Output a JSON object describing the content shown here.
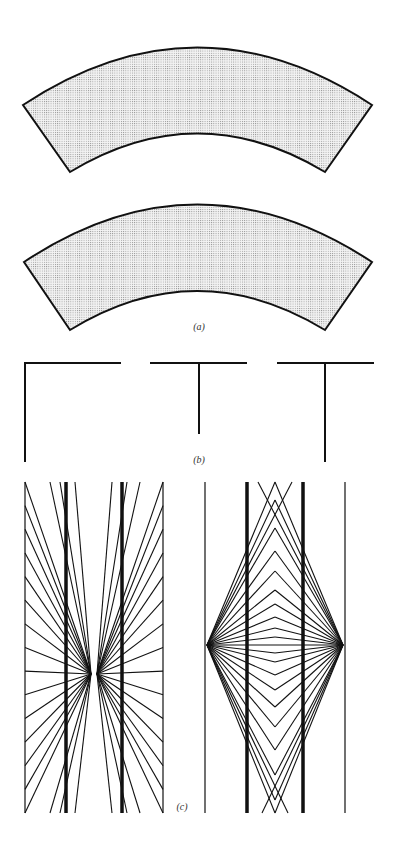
{
  "figure": {
    "panels": [
      {
        "id": "a",
        "label": "(a)",
        "description": "Jastrow illusion: two identical shaded annular sectors stacked vertically",
        "shapes": [
          {
            "name": "upper-arc",
            "fill": "dotted-gray"
          },
          {
            "name": "lower-arc",
            "fill": "dotted-gray"
          }
        ]
      },
      {
        "id": "b",
        "label": "(b)",
        "description": "Horizontal-vertical illusion: L-shape and two inverted T shapes",
        "shapes": [
          {
            "name": "l-shape"
          },
          {
            "name": "short-t-shape"
          },
          {
            "name": "long-t-shape"
          }
        ]
      },
      {
        "id": "c",
        "label": "(c)",
        "description": "Hering and Wundt illusions: parallel bold lines over radiating line patterns",
        "shapes": [
          {
            "name": "hering-figure",
            "focal_points": 2
          },
          {
            "name": "wundt-figure",
            "focal_points": 2
          }
        ]
      }
    ],
    "colors": {
      "stroke": "#111111",
      "fill_dots": "#8a8a8a",
      "background": "#ffffff",
      "label": "#333333"
    }
  }
}
